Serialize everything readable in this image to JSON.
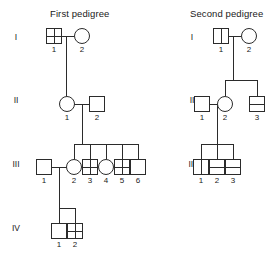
{
  "figure": {
    "background_color": "#ffffff",
    "stroke_color": "#2b2b2b",
    "text_color": "#1a1a1a"
  },
  "pedigrees": [
    {
      "id": "first-pedigree",
      "title": "First pedigree",
      "generation_labels": [
        "I",
        "II",
        "III",
        "IV"
      ],
      "individuals": [
        {
          "generation": "I",
          "number": "1",
          "sex": "male",
          "symbol": "square",
          "marking": "cross"
        },
        {
          "generation": "I",
          "number": "2",
          "sex": "female",
          "symbol": "circle",
          "marking": "none"
        },
        {
          "generation": "II",
          "number": "1",
          "sex": "female",
          "symbol": "circle",
          "marking": "none"
        },
        {
          "generation": "II",
          "number": "2",
          "sex": "male",
          "symbol": "square",
          "marking": "none"
        },
        {
          "generation": "III",
          "number": "1",
          "sex": "male",
          "symbol": "square",
          "marking": "none"
        },
        {
          "generation": "III",
          "number": "2",
          "sex": "female",
          "symbol": "circle",
          "marking": "none"
        },
        {
          "generation": "III",
          "number": "3",
          "sex": "male",
          "symbol": "square",
          "marking": "cross"
        },
        {
          "generation": "III",
          "number": "4",
          "sex": "female",
          "symbol": "circle",
          "marking": "none"
        },
        {
          "generation": "III",
          "number": "5",
          "sex": "male",
          "symbol": "square",
          "marking": "cross"
        },
        {
          "generation": "III",
          "number": "6",
          "sex": "male",
          "symbol": "square",
          "marking": "none"
        },
        {
          "generation": "IV",
          "number": "1",
          "sex": "male",
          "symbol": "square",
          "marking": "none"
        },
        {
          "generation": "IV",
          "number": "2",
          "sex": "male",
          "symbol": "square",
          "marking": "cross"
        }
      ],
      "matings": [
        {
          "partners": [
            "I-1",
            "I-2"
          ],
          "children": [
            "II-1"
          ]
        },
        {
          "partners": [
            "II-1",
            "II-2"
          ],
          "children": [
            "III-2",
            "III-3",
            "III-4",
            "III-5",
            "III-6"
          ]
        },
        {
          "partners": [
            "III-1",
            "III-2"
          ],
          "children": [
            "IV-1",
            "IV-2"
          ]
        }
      ]
    },
    {
      "id": "second-pedigree",
      "title": "Second pedigree",
      "generation_labels": [
        "I",
        "II",
        "III"
      ],
      "individuals": [
        {
          "generation": "I",
          "number": "1",
          "sex": "male",
          "symbol": "square",
          "marking": "vertical-bar"
        },
        {
          "generation": "I",
          "number": "2",
          "sex": "female",
          "symbol": "circle",
          "marking": "none"
        },
        {
          "generation": "II",
          "number": "1",
          "sex": "male",
          "symbol": "square",
          "marking": "none"
        },
        {
          "generation": "II",
          "number": "2",
          "sex": "female",
          "symbol": "circle",
          "marking": "none"
        },
        {
          "generation": "II",
          "number": "3",
          "sex": "male",
          "symbol": "square",
          "marking": "horizontal-bar"
        },
        {
          "generation": "III",
          "number": "1",
          "sex": "male",
          "symbol": "square",
          "marking": "vertical-bar"
        },
        {
          "generation": "III",
          "number": "2",
          "sex": "male",
          "symbol": "square",
          "marking": "horizontal-bar"
        },
        {
          "generation": "III",
          "number": "3",
          "sex": "male",
          "symbol": "square",
          "marking": "horizontal-bar"
        }
      ],
      "matings": [
        {
          "partners": [
            "I-1",
            "I-2"
          ],
          "children": [
            "II-2",
            "II-3"
          ]
        },
        {
          "partners": [
            "II-1",
            "II-2"
          ],
          "children": [
            "III-1",
            "III-2",
            "III-3"
          ]
        }
      ]
    }
  ]
}
